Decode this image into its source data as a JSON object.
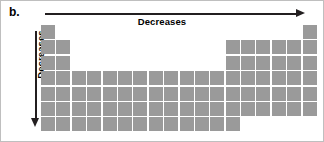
{
  "figure": {
    "panel_label": "b.",
    "background_color": "#ffffff",
    "border_color": "#bfbfbf"
  },
  "axes": {
    "horizontal": {
      "label": "Decreases",
      "direction": "right",
      "arrow_color": "#231f20",
      "icon": "arrow-right-icon"
    },
    "vertical": {
      "label": "Decreases",
      "direction": "down",
      "arrow_color": "#231f20",
      "icon": "arrow-down-icon"
    }
  },
  "chart_data": {
    "type": "heatmap",
    "title": "",
    "subtitle": "",
    "xlabel": "Decreases",
    "ylabel": "Decreases",
    "cell_color": "#9a9a9a",
    "columns": 18,
    "rows": 7,
    "row_labels": [
      "1",
      "2",
      "3",
      "4",
      "5",
      "6",
      "7"
    ],
    "column_labels": [
      "1",
      "2",
      "3",
      "4",
      "5",
      "6",
      "7",
      "8",
      "9",
      "10",
      "11",
      "12",
      "13",
      "14",
      "15",
      "16",
      "17",
      "18"
    ],
    "filled_counts": [
      2,
      8,
      8,
      18,
      18,
      18,
      13
    ],
    "matrix": [
      [
        1,
        0,
        0,
        0,
        0,
        0,
        0,
        0,
        0,
        0,
        0,
        0,
        0,
        0,
        0,
        0,
        0,
        1
      ],
      [
        1,
        1,
        0,
        0,
        0,
        0,
        0,
        0,
        0,
        0,
        0,
        0,
        1,
        1,
        1,
        1,
        1,
        1
      ],
      [
        1,
        1,
        0,
        0,
        0,
        0,
        0,
        0,
        0,
        0,
        0,
        0,
        1,
        1,
        1,
        1,
        1,
        1
      ],
      [
        1,
        1,
        1,
        1,
        1,
        1,
        1,
        1,
        1,
        1,
        1,
        1,
        1,
        1,
        1,
        1,
        1,
        1
      ],
      [
        1,
        1,
        1,
        1,
        1,
        1,
        1,
        1,
        1,
        1,
        1,
        1,
        1,
        1,
        1,
        1,
        1,
        1
      ],
      [
        1,
        1,
        1,
        1,
        1,
        1,
        1,
        1,
        1,
        1,
        1,
        1,
        1,
        1,
        1,
        1,
        1,
        1
      ],
      [
        1,
        1,
        1,
        1,
        1,
        1,
        1,
        1,
        1,
        1,
        1,
        1,
        1,
        0,
        0,
        0,
        0,
        0
      ]
    ]
  }
}
